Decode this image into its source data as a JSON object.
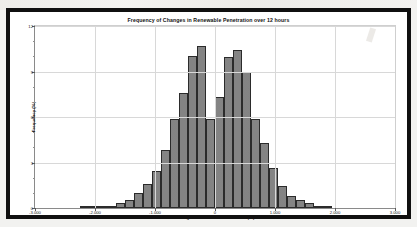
{
  "chart_data": {
    "type": "bar",
    "title": "Frequency of Changes in Renewable Penetration over 12 hours",
    "xlabel": "Change in Renewable Penetration (%)",
    "ylabel": "Frequency (%)",
    "xlim": [
      -3.0,
      3.0
    ],
    "ylim": [
      0,
      12
    ],
    "grid": true,
    "legend": "none",
    "bin_width": 0.15,
    "y_ticks": [
      "0",
      "3",
      "6",
      "9",
      "12"
    ],
    "y_tick_values": [
      0,
      3,
      6,
      9,
      12
    ],
    "x_ticks": [
      "-3.000",
      "-2.000",
      "-1.000",
      "0",
      "1.000",
      "2.000",
      "3.000"
    ],
    "x_tick_values": [
      -3,
      -2,
      -1,
      0,
      1,
      2,
      3
    ],
    "bar_color": "#767676",
    "bar_edge_color": "#2b2b2b",
    "categories": [
      "-2.175",
      "-2.025",
      "-1.875",
      "-1.725",
      "-1.575",
      "-1.425",
      "-1.275",
      "-1.125",
      "-0.975",
      "-0.825",
      "-0.675",
      "-0.525",
      "-0.375",
      "-0.225",
      "-0.075",
      "0.075",
      "0.225",
      "0.375",
      "0.525",
      "0.675",
      "0.825",
      "0.975",
      "1.125",
      "1.275",
      "1.425",
      "1.575",
      "1.725",
      "1.875"
    ],
    "values": [
      0.12,
      0.1,
      0.08,
      0.07,
      0.3,
      0.55,
      1.0,
      1.6,
      2.45,
      3.85,
      5.85,
      7.6,
      10.05,
      10.7,
      5.85,
      7.3,
      9.95,
      10.45,
      8.95,
      5.9,
      4.3,
      2.65,
      1.45,
      0.8,
      0.55,
      0.3,
      0.12,
      0.08
    ]
  },
  "window": {
    "border_color": "#101010",
    "background": "#ffffff"
  }
}
